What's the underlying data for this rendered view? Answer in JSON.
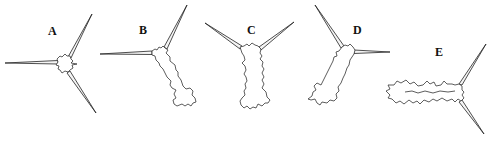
{
  "figure": {
    "panels": [
      {
        "id": "A",
        "label": "A",
        "x": 48,
        "y": 25
      },
      {
        "id": "B",
        "label": "B",
        "x": 139,
        "y": 24
      },
      {
        "id": "C",
        "label": "C",
        "x": 247,
        "y": 24
      },
      {
        "id": "D",
        "label": "D",
        "x": 353,
        "y": 24
      },
      {
        "id": "E",
        "label": "E",
        "x": 435,
        "y": 46
      }
    ],
    "line_color": "#222222",
    "background": "#ffffff"
  }
}
